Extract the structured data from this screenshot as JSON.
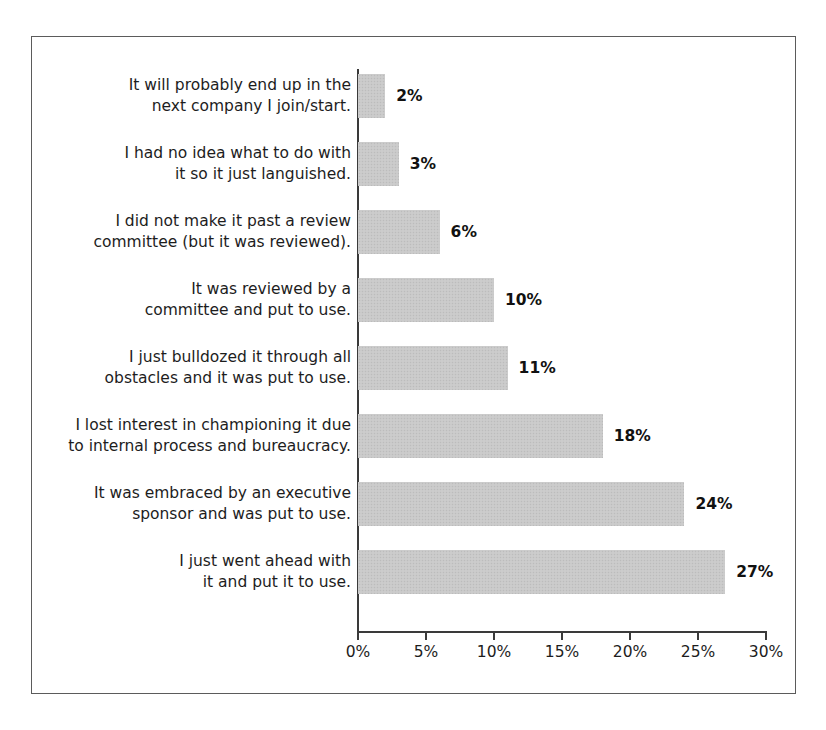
{
  "chart_data": {
    "type": "bar",
    "orientation": "horizontal",
    "title": "",
    "xlabel": "",
    "ylabel": "",
    "xlim": [
      0,
      30
    ],
    "grid": false,
    "legend": false,
    "value_suffix": "%",
    "categories": [
      "It will probably end up in the\nnext company I join/start.",
      "I had no idea what to do with\nit so it just languished.",
      "I did not make it past a review\ncommittee (but it was reviewed).",
      "It was reviewed by a\ncommittee and put to use.",
      "I just bulldozed it through all\nobstacles and it was put to use.",
      "I lost interest in championing it due\nto internal process and bureaucracy.",
      "It was embraced by an executive\nsponsor and was put to use.",
      "I just went ahead with\nit and put it to use."
    ],
    "values": [
      2,
      3,
      6,
      10,
      11,
      18,
      24,
      27
    ],
    "value_labels": [
      "2%",
      "3%",
      "6%",
      "10%",
      "11%",
      "18%",
      "24%",
      "27%"
    ],
    "xticks": [
      0,
      5,
      10,
      15,
      20,
      25,
      30
    ],
    "xtick_labels": [
      "0%",
      "5%",
      "10%",
      "15%",
      "20%",
      "25%",
      "30%"
    ],
    "bar_color": "#c9c9c9",
    "axis_color": "#3a3a3a",
    "text_color": "#1d1d1d",
    "frame_color": "#5b5b5b"
  }
}
